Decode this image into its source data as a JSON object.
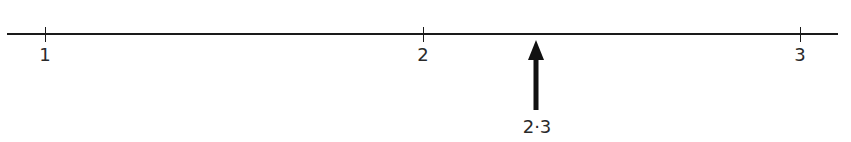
{
  "number_line": {
    "min": 1,
    "max": 3,
    "ticks": [
      {
        "value": 1,
        "label": "1"
      },
      {
        "value": 2,
        "label": "2"
      },
      {
        "value": 3,
        "label": "3"
      }
    ],
    "marker": {
      "value": 2.3,
      "label": "2·3",
      "direction": "up"
    }
  },
  "colors": {
    "line": "#1a1a1a",
    "text": "#2a2a2a"
  }
}
